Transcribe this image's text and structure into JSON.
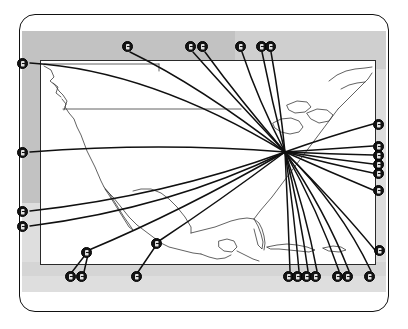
{
  "figure": {
    "title": "",
    "caption": "",
    "type": "hub-and-spoke route map",
    "region": "North America",
    "hub": {
      "label": "",
      "x": 285,
      "y": 152
    },
    "colors": {
      "ink": "#141414",
      "map_stroke": "#2a2a2a",
      "panel_light": "#dedede",
      "panel_dark": "#c2c2c2",
      "card_bg": "#ffffff",
      "marker_fill": "#141414",
      "marker_text": "#ffffff"
    },
    "counts": {
      "markers_total": 25,
      "routes_total": 25
    }
  },
  "markers": [
    {
      "id": "m01",
      "label": "",
      "x": 22,
      "y": 63,
      "side": "left"
    },
    {
      "id": "m02",
      "label": "",
      "x": 22,
      "y": 152,
      "side": "left"
    },
    {
      "id": "m03",
      "label": "",
      "x": 22,
      "y": 211,
      "side": "left"
    },
    {
      "id": "m04",
      "label": "",
      "x": 22,
      "y": 226,
      "side": "left"
    },
    {
      "id": "m05",
      "label": "",
      "x": 127,
      "y": 46,
      "side": "top"
    },
    {
      "id": "m06",
      "label": "",
      "x": 190,
      "y": 46,
      "side": "top"
    },
    {
      "id": "m07",
      "label": "",
      "x": 202,
      "y": 46,
      "side": "top"
    },
    {
      "id": "m08",
      "label": "",
      "x": 240,
      "y": 46,
      "side": "top"
    },
    {
      "id": "m09",
      "label": "",
      "x": 261,
      "y": 46,
      "side": "top"
    },
    {
      "id": "m10",
      "label": "",
      "x": 270,
      "y": 46,
      "side": "top"
    },
    {
      "id": "m11",
      "label": "",
      "x": 378,
      "y": 124,
      "side": "right"
    },
    {
      "id": "m12",
      "label": "",
      "x": 378,
      "y": 146,
      "side": "right"
    },
    {
      "id": "m13",
      "label": "",
      "x": 378,
      "y": 155,
      "side": "right"
    },
    {
      "id": "m14",
      "label": "",
      "x": 378,
      "y": 164,
      "side": "right"
    },
    {
      "id": "m15",
      "label": "",
      "x": 378,
      "y": 173,
      "side": "right"
    },
    {
      "id": "m16",
      "label": "",
      "x": 378,
      "y": 190,
      "side": "right"
    },
    {
      "id": "m17",
      "label": "",
      "x": 379,
      "y": 250,
      "side": "right"
    },
    {
      "id": "m18",
      "label": "",
      "x": 86,
      "y": 252,
      "side": "inner"
    },
    {
      "id": "m19",
      "label": "",
      "x": 70,
      "y": 276,
      "side": "bottom"
    },
    {
      "id": "m20",
      "label": "",
      "x": 81,
      "y": 276,
      "side": "bottom"
    },
    {
      "id": "m21",
      "label": "",
      "x": 156,
      "y": 243,
      "side": "inner"
    },
    {
      "id": "m22",
      "label": "",
      "x": 136,
      "y": 276,
      "side": "bottom"
    },
    {
      "id": "m23",
      "label": "",
      "x": 288,
      "y": 276,
      "side": "bottom"
    },
    {
      "id": "m24",
      "label": "",
      "x": 297,
      "y": 276,
      "side": "bottom"
    },
    {
      "id": "m25",
      "label": "",
      "x": 306,
      "y": 276,
      "side": "bottom"
    },
    {
      "id": "m26",
      "label": "",
      "x": 315,
      "y": 276,
      "side": "bottom"
    },
    {
      "id": "m27",
      "label": "",
      "x": 337,
      "y": 276,
      "side": "bottom"
    },
    {
      "id": "m28",
      "label": "",
      "x": 347,
      "y": 276,
      "side": "bottom"
    },
    {
      "id": "m29",
      "label": "",
      "x": 369,
      "y": 276,
      "side": "bottom"
    }
  ],
  "chart_data": {
    "type": "scatter",
    "title": "",
    "xlabel": "",
    "ylabel": "",
    "legend": [],
    "annotations": [],
    "hub": {
      "x": 285,
      "y": 152
    },
    "routes": [
      {
        "from": "m01",
        "cx": 150,
        "cy": 72,
        "to_hub": true
      },
      {
        "from": "m02",
        "cx": 150,
        "cy": 140,
        "to_hub": true
      },
      {
        "from": "m03",
        "cx": 150,
        "cy": 200,
        "to_hub": true
      },
      {
        "from": "m04",
        "cx": 150,
        "cy": 215,
        "to_hub": true
      },
      {
        "from": "m05",
        "cx": 190,
        "cy": 80,
        "to_hub": true
      },
      {
        "from": "m06",
        "cx": 225,
        "cy": 80,
        "to_hub": true
      },
      {
        "from": "m07",
        "cx": 232,
        "cy": 80,
        "to_hub": true
      },
      {
        "from": "m08",
        "cx": 252,
        "cy": 95,
        "to_hub": true
      },
      {
        "from": "m09",
        "cx": 268,
        "cy": 95,
        "to_hub": true
      },
      {
        "from": "m10",
        "cx": 276,
        "cy": 95,
        "to_hub": true
      },
      {
        "from": "m11",
        "cx": 330,
        "cy": 136,
        "to_hub": true
      },
      {
        "from": "m12",
        "cx": 330,
        "cy": 148,
        "to_hub": true
      },
      {
        "from": "m13",
        "cx": 330,
        "cy": 153,
        "to_hub": true
      },
      {
        "from": "m14",
        "cx": 330,
        "cy": 158,
        "to_hub": true
      },
      {
        "from": "m15",
        "cx": 330,
        "cy": 164,
        "to_hub": true
      },
      {
        "from": "m16",
        "cx": 330,
        "cy": 172,
        "to_hub": true
      },
      {
        "from": "m17",
        "cx": 335,
        "cy": 205,
        "to_hub": true
      },
      {
        "from": "m18",
        "cx": 175,
        "cy": 215,
        "to_hub": true
      },
      {
        "from": "m21",
        "cx": 215,
        "cy": 205,
        "to_hub": true
      },
      {
        "from": "m23",
        "cx": 288,
        "cy": 215,
        "to_hub": true
      },
      {
        "from": "m24",
        "cx": 295,
        "cy": 215,
        "to_hub": true
      },
      {
        "from": "m25",
        "cx": 302,
        "cy": 215,
        "to_hub": true
      },
      {
        "from": "m26",
        "cx": 310,
        "cy": 215,
        "to_hub": true
      },
      {
        "from": "m27",
        "cx": 322,
        "cy": 210,
        "to_hub": true
      },
      {
        "from": "m28",
        "cx": 330,
        "cy": 210,
        "to_hub": true
      },
      {
        "from": "m29",
        "cx": 345,
        "cy": 205,
        "to_hub": true
      }
    ]
  }
}
